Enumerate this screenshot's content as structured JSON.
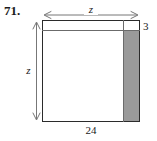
{
  "figure": {
    "problem_number": "71.",
    "type": "geometry-diagram",
    "shape": "square-with-removed-border-strips",
    "labels": {
      "top_width": "z",
      "left_height": "z",
      "right_strip_width": "3",
      "bottom_width": "24"
    },
    "colors": {
      "outline": "#2b2b2b",
      "inner_rule": "#6b6b6b",
      "shaded_region": "#9a9a9a",
      "background": "#ffffff",
      "text": "#1a1a1a"
    },
    "icons": {
      "top_dimension": "double-headed-horizontal-arrow-icon",
      "left_dimension": "double-headed-vertical-arrow-icon"
    }
  }
}
